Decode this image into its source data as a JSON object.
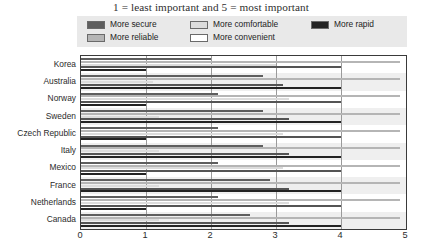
{
  "title": "1 = least important and 5 = most important",
  "legend": {
    "entries": [
      {
        "label": "More secure",
        "color": "#5e5e5e"
      },
      {
        "label": "More reliable",
        "color": "#b5b5b5"
      },
      {
        "label": "More comfortable",
        "color": "#dcdcdc"
      },
      {
        "label": "More convenient",
        "color": "#ffffff"
      },
      {
        "label": "More rapid",
        "color": "#232323"
      }
    ],
    "background": "#e9e9e9"
  },
  "axis": {
    "x_ticks": [
      "0",
      "1",
      "2",
      "3",
      "4",
      "5"
    ],
    "x_min": 0,
    "x_max": 5
  },
  "chart_data": {
    "type": "bar",
    "orientation": "horizontal",
    "title": "1 = least important and 5 = most important",
    "xlabel": "",
    "ylabel": "",
    "xlim": [
      0,
      5
    ],
    "grid": true,
    "legend_position": "top",
    "categories": [
      "Korea",
      "Australia",
      "Norway",
      "Sweden",
      "Czech Republic",
      "Italy",
      "Mexico",
      "France",
      "Netherlands",
      "Canada"
    ],
    "series": [
      {
        "name": "More secure",
        "color": "#5e5e5e",
        "values": [
          2.0,
          2.8,
          2.1,
          2.8,
          2.1,
          2.8,
          2.1,
          2.9,
          2.1,
          2.6
        ]
      },
      {
        "name": "More reliable",
        "color": "#b5b5b5",
        "values": [
          4.9,
          4.9,
          4.9,
          4.9,
          4.9,
          4.9,
          4.9,
          4.9,
          4.9,
          4.9
        ]
      },
      {
        "name": "More comfortable",
        "color": "#dcdcdc",
        "values": [
          3.0,
          1.1,
          3.2,
          1.2,
          3.1,
          1.2,
          3.1,
          1.2,
          3.2,
          1.2
        ]
      },
      {
        "name": "More convenient",
        "color": "#ffffff",
        "values": [
          4.0,
          3.1,
          4.0,
          3.2,
          4.0,
          3.2,
          4.0,
          3.2,
          4.0,
          3.2
        ]
      },
      {
        "name": "More rapid",
        "color": "#232323",
        "values": [
          1.0,
          4.0,
          1.0,
          4.0,
          1.0,
          4.0,
          1.0,
          4.0,
          1.0,
          4.0
        ]
      }
    ]
  }
}
